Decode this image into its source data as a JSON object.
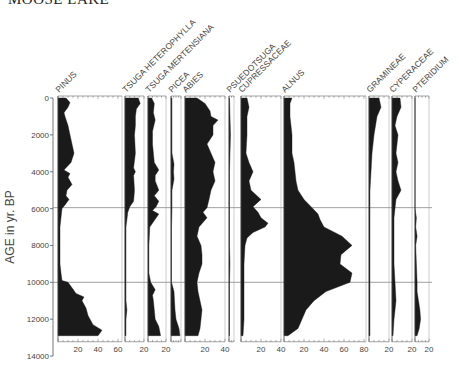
{
  "title": "MOOSE LAKE",
  "chart_data": {
    "type": "area",
    "subtype": "pollen-stratigraphic-diagram",
    "title": "MOOSE LAKE",
    "ylabel": "AGE in yr. BP",
    "xlabel": "",
    "ylim": [
      0,
      14000
    ],
    "y_inverted": true,
    "y_ticks": [
      0,
      2000,
      4000,
      6000,
      8000,
      10000,
      12000,
      14000
    ],
    "zone_lines": [
      5950,
      10000
    ],
    "grid": false,
    "legend": null,
    "units": "percent",
    "series": [
      {
        "name": "PINUS",
        "base_x": 58,
        "px_per_pct": 1.0,
        "axis_max": 64,
        "ticks": [
          20,
          40,
          60
        ],
        "depths": [
          0,
          250,
          500,
          800,
          1000,
          1500,
          2000,
          2500,
          3000,
          3500,
          3900,
          4100,
          4300,
          4700,
          5000,
          5300,
          5500,
          5800,
          6000,
          6500,
          7000,
          8000,
          9000,
          9500,
          9900,
          10000,
          10300,
          10600,
          10800,
          11000,
          11400,
          11800,
          12100,
          12300,
          12600,
          12900
        ],
        "values": [
          8,
          12,
          10,
          6,
          7,
          10,
          12,
          14,
          16,
          13,
          6,
          12,
          10,
          14,
          9,
          8,
          11,
          7,
          4,
          3,
          2,
          2,
          2,
          3,
          4,
          10,
          14,
          18,
          26,
          24,
          28,
          30,
          33,
          35,
          44,
          40
        ]
      },
      {
        "name": "TSUGA HETEROPHYLLA",
        "base_x": 125,
        "px_per_pct": 0.95,
        "axis_max": 20,
        "ticks": [
          20
        ],
        "depths": [
          0,
          300,
          600,
          1000,
          1500,
          2000,
          3000,
          3800,
          4000,
          4200,
          5000,
          5600,
          5900,
          6200,
          7000,
          8000,
          9000,
          10000,
          11000,
          11500,
          12000,
          12900
        ],
        "values": [
          14,
          16,
          12,
          11,
          11,
          10,
          11,
          9,
          11,
          9,
          10,
          9,
          5,
          3,
          1,
          1,
          1,
          1,
          1,
          2,
          1,
          1
        ]
      },
      {
        "name": "TSUGA MERTENSIANA",
        "base_x": 148,
        "px_per_pct": 0.9,
        "axis_max": 20,
        "ticks": [
          20
        ],
        "depths": [
          0,
          300,
          800,
          1200,
          1800,
          2500,
          3500,
          3900,
          4200,
          4500,
          5000,
          5300,
          5600,
          5900,
          6100,
          6300,
          7000,
          8000,
          9500,
          10000,
          10400,
          10700,
          11000,
          11500,
          12000,
          12400,
          12900
        ],
        "values": [
          4,
          7,
          6,
          8,
          5,
          5,
          7,
          12,
          8,
          8,
          12,
          7,
          12,
          9,
          5,
          12,
          2,
          1,
          1,
          3,
          8,
          5,
          6,
          7,
          8,
          12,
          14
        ]
      },
      {
        "name": "PICEA",
        "base_x": 171,
        "px_per_pct": 0.5,
        "axis_max": 20,
        "ticks": [],
        "depths": [
          0,
          1000,
          2000,
          3000,
          3600,
          4000,
          4400,
          5000,
          6000,
          7000,
          8000,
          9000,
          10000,
          10500,
          11000,
          11500,
          12000,
          12500,
          12900
        ],
        "values": [
          2,
          2,
          2,
          2,
          6,
          5,
          6,
          2,
          2,
          1,
          1,
          1,
          1,
          6,
          7,
          8,
          10,
          16,
          18
        ]
      },
      {
        "name": "ABIES",
        "base_x": 185,
        "px_per_pct": 1.0,
        "axis_max": 40,
        "ticks": [
          20,
          40
        ],
        "depths": [
          0,
          300,
          700,
          1000,
          1200,
          1500,
          2000,
          2500,
          3000,
          3500,
          4000,
          4500,
          5000,
          5500,
          5950,
          6200,
          6500,
          7000,
          7500,
          8000,
          8500,
          9000,
          9500,
          10000,
          10500,
          11000,
          11500,
          12000,
          12500,
          12900
        ],
        "values": [
          12,
          20,
          25,
          26,
          33,
          28,
          28,
          22,
          26,
          30,
          28,
          30,
          26,
          24,
          22,
          18,
          22,
          14,
          12,
          16,
          17,
          17,
          14,
          12,
          13,
          15,
          17,
          16,
          15,
          13
        ]
      },
      {
        "name": "PSUEDOTSUGA",
        "base_x": 229,
        "px_per_pct": 0.5,
        "axis_max": 10,
        "ticks": [],
        "depths": [
          0,
          1000,
          2000,
          3000,
          4000,
          6000,
          8000,
          9000,
          10000,
          12000,
          12900
        ],
        "values": [
          1,
          2,
          3,
          2,
          1,
          1,
          1,
          2,
          1,
          1,
          1
        ]
      },
      {
        "name": "CUPRESSACEAE",
        "base_x": 241,
        "px_per_pct": 1.0,
        "axis_max": 40,
        "ticks": [
          20,
          40
        ],
        "depths": [
          0,
          500,
          1000,
          2000,
          3000,
          3500,
          4000,
          4500,
          5000,
          5500,
          5900,
          6200,
          6500,
          6800,
          7000,
          7300,
          7600,
          8000,
          9000,
          10000,
          11000,
          12000,
          12900
        ],
        "values": [
          6,
          8,
          6,
          6,
          5,
          8,
          12,
          8,
          10,
          20,
          12,
          17,
          20,
          27,
          24,
          12,
          6,
          4,
          3,
          3,
          3,
          3,
          2
        ]
      },
      {
        "name": "ALNUS",
        "base_x": 284,
        "px_per_pct": 1.0,
        "axis_max": 84,
        "ticks": [
          20,
          40,
          60,
          80
        ],
        "depths": [
          0,
          300,
          1000,
          2000,
          3000,
          3500,
          4500,
          5000,
          5500,
          5950,
          6300,
          6600,
          7000,
          7500,
          8000,
          8500,
          9000,
          9500,
          10000,
          10500,
          11000,
          11500,
          12000,
          12500,
          12900
        ],
        "values": [
          8,
          6,
          6,
          8,
          8,
          10,
          12,
          14,
          20,
          28,
          34,
          36,
          40,
          58,
          68,
          57,
          56,
          68,
          66,
          42,
          30,
          22,
          18,
          14,
          4
        ]
      },
      {
        "name": "GRAMINEAE",
        "base_x": 369,
        "px_per_pct": 1.0,
        "axis_max": 20,
        "ticks": [
          20
        ],
        "depths": [
          0,
          500,
          1000,
          2000,
          3000,
          4000,
          5000,
          6000,
          8000,
          10000,
          12000,
          12900
        ],
        "values": [
          10,
          12,
          8,
          5,
          3,
          2,
          1,
          1,
          1,
          1,
          1,
          1
        ]
      },
      {
        "name": "CYPERACEAE",
        "base_x": 392,
        "px_per_pct": 1.0,
        "axis_max": 20,
        "ticks": [
          20
        ],
        "depths": [
          0,
          500,
          1000,
          1500,
          2000,
          3000,
          3500,
          4000,
          4500,
          5000,
          5500,
          6000,
          6500,
          7000,
          8000,
          9000,
          10000,
          11000,
          12000,
          12900
        ],
        "values": [
          8,
          9,
          5,
          3,
          6,
          4,
          6,
          4,
          6,
          9,
          4,
          3,
          2,
          2,
          2,
          2,
          3,
          4,
          2,
          1
        ]
      },
      {
        "name": "PTERIDIUM",
        "base_x": 415,
        "px_per_pct": 0.7,
        "axis_max": 20,
        "ticks": [
          20
        ],
        "depths": [
          0,
          4000,
          6000,
          6500,
          7000,
          7500,
          8000,
          9000,
          10000,
          10500,
          11000,
          11500,
          12000,
          12500,
          12900
        ],
        "values": [
          0,
          0,
          0,
          2,
          1,
          3,
          1,
          2,
          3,
          3,
          5,
          7,
          8,
          6,
          3
        ]
      }
    ]
  }
}
